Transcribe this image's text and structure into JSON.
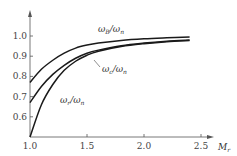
{
  "chart_data": {
    "type": "line",
    "title": "",
    "xlabel": "Mr",
    "ylabel": "",
    "xlim": [
      1.0,
      2.6
    ],
    "ylim": [
      0.5,
      1.08
    ],
    "grid": false,
    "xticks": [
      "1.0",
      "1.5",
      "2.0",
      "2.5"
    ],
    "yticks": [
      "0.6",
      "0.7",
      "0.8",
      "0.9",
      "1.0"
    ],
    "series": [
      {
        "name": "ωB/ωn",
        "x": [
          1.0,
          1.1,
          1.2,
          1.3,
          1.4,
          1.5,
          1.6,
          1.8,
          2.0,
          2.2,
          2.4
        ],
        "values": [
          0.77,
          0.835,
          0.88,
          0.915,
          0.94,
          0.955,
          0.965,
          0.978,
          0.986,
          0.991,
          0.995
        ]
      },
      {
        "name": "ωc/ωn",
        "x": [
          1.0,
          1.1,
          1.2,
          1.3,
          1.4,
          1.5,
          1.6,
          1.8,
          2.0,
          2.2,
          2.4
        ],
        "values": [
          0.67,
          0.75,
          0.81,
          0.855,
          0.89,
          0.915,
          0.93,
          0.952,
          0.965,
          0.974,
          0.98
        ]
      },
      {
        "name": "ωr/ωn",
        "x": [
          1.0,
          1.1,
          1.2,
          1.3,
          1.4,
          1.5,
          1.6,
          1.8,
          2.0,
          2.2,
          2.4
        ],
        "values": [
          0.5,
          0.66,
          0.76,
          0.83,
          0.875,
          0.905,
          0.925,
          0.948,
          0.962,
          0.972,
          0.978
        ]
      }
    ],
    "annotations": [
      {
        "text": "ωB/ωn",
        "base": "ω",
        "sub1": "B",
        "sub2": "n"
      },
      {
        "text": "ωc/ωn",
        "base": "ω",
        "sub1": "c",
        "sub2": "n"
      },
      {
        "text": "ωr/ωn",
        "base": "ω",
        "sub1": "r",
        "sub2": "n"
      }
    ],
    "axis_label_x": {
      "base": "M",
      "sub": "r"
    }
  }
}
